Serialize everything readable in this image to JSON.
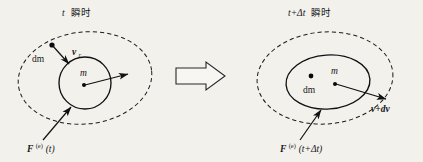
{
  "figure": {
    "title": "",
    "background_color": "#f2f1ec",
    "ink_color": "#101013",
    "panels": [
      {
        "id": "left-panel",
        "caption": {
          "variable": "t",
          "cjk": "瞬时",
          "full": "t 瞬时"
        },
        "outer_boundary": {
          "shape": "ellipse",
          "style": "dashed",
          "label": "system-control-volume"
        },
        "inner_body": {
          "shape": "circle",
          "style": "solid",
          "label": "m",
          "center_dot": true
        },
        "particle": {
          "label": "dm",
          "dot": true
        },
        "vectors": [
          {
            "name": "relative-velocity",
            "label_base": "v",
            "label_sub": "r",
            "label_full": "v_r",
            "direction": "down-right"
          },
          {
            "name": "body-velocity",
            "label_base": "",
            "label_full": "",
            "direction": "right"
          },
          {
            "name": "external-force",
            "label_base": "F",
            "label_sup": "(e)",
            "label_arg": "(t)",
            "label_full": "F^(e)(t)",
            "direction": "up-right"
          }
        ]
      },
      {
        "id": "right-panel",
        "caption": {
          "variable": "t+Δt",
          "cjk": "瞬时",
          "full": "t+Δt 瞬时"
        },
        "outer_boundary": {
          "shape": "ellipse",
          "style": "dashed",
          "label": "system-control-volume"
        },
        "inner_body": {
          "shape": "ellipse",
          "style": "solid",
          "label": "m",
          "center_dot": true
        },
        "particle": {
          "label": "dm",
          "dot": true
        },
        "vectors": [
          {
            "name": "body-velocity",
            "label_base": "v+dv",
            "label_full": "v+dv",
            "direction": "down-right"
          },
          {
            "name": "external-force",
            "label_base": "F",
            "label_sup": "(e)",
            "label_arg": "(t+Δt)",
            "label_full": "F^(e)(t+Δt)",
            "direction": "up-right"
          }
        ]
      }
    ],
    "transition_arrow": {
      "name": "implies-arrow",
      "style": "outlined-block-arrow",
      "direction": "right"
    },
    "labels": {
      "left_caption_var": "t",
      "left_caption_cjk": "瞬时",
      "left_dm": "dm",
      "left_m": "m",
      "left_v_base": "v",
      "left_v_sub": "r",
      "left_F_base": "F",
      "left_F_sup": "(e)",
      "left_F_arg": "(t)",
      "right_caption_var": "t+Δt",
      "right_caption_cjk": "瞬时",
      "right_dm": "dm",
      "right_m": "m",
      "right_v": "v+dv",
      "right_F_base": "F",
      "right_F_sup": "(e)",
      "right_F_arg": "(t+Δt)"
    }
  }
}
